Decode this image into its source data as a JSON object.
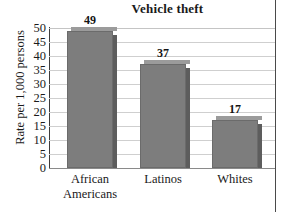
{
  "chart_data": {
    "type": "bar",
    "title": "Vehicle theft",
    "xlabel": "",
    "ylabel": "Rate per 1,000 persons",
    "categories": [
      "African Americans",
      "Latinos",
      "Whites"
    ],
    "category_lines": [
      [
        "African",
        "Americans"
      ],
      [
        "Latinos"
      ],
      [
        "Whites"
      ]
    ],
    "values": [
      49,
      37,
      17
    ],
    "value_labels": [
      "49",
      "37",
      "17"
    ],
    "ylim": [
      0,
      50
    ],
    "ytick_step": 5,
    "yticks": [
      50,
      45,
      40,
      35,
      30,
      25,
      20,
      15,
      10,
      5,
      0
    ],
    "ytick_labels": [
      "50",
      "45",
      "40",
      "35",
      "30",
      "25",
      "20",
      "15",
      "10",
      "5",
      "0"
    ],
    "grid": true,
    "legend": false,
    "bar_color": "#7d7d7d",
    "bar_shadow_color": "#5d5d5d",
    "gridline_color": "#cfcfcf",
    "axis_color": "#3d3d3d",
    "text_color": "#1a1a1a"
  }
}
